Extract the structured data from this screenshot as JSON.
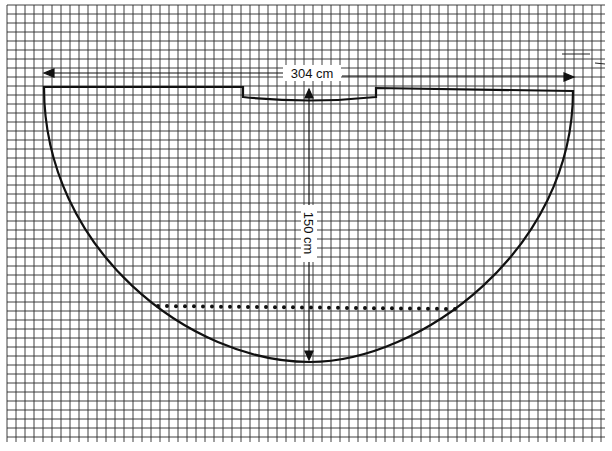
{
  "diagram": {
    "type": "sewing-pattern",
    "width_label": "304 cm",
    "length_label": "150 cm",
    "grid": {
      "x0": 7,
      "y0": 5,
      "x1": 605,
      "y1": 442,
      "step": 9,
      "color": "#222222"
    },
    "outline_color": "#111111"
  }
}
